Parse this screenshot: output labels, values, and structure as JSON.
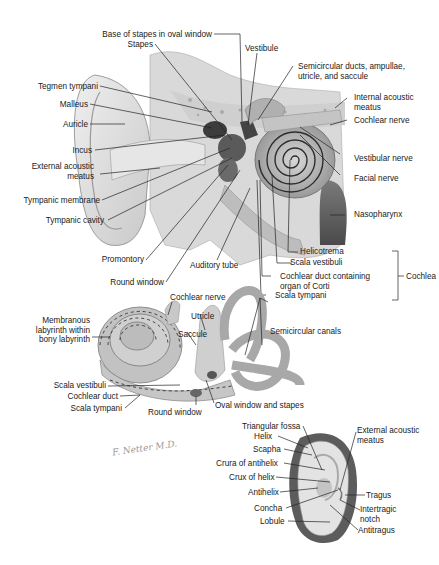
{
  "figure": {
    "signature": "F. Netter M.D."
  },
  "middle_ear_section": {
    "labels": {
      "base_of_stapes": "Base of stapes in oval window",
      "stapes": "Stapes",
      "vestibule": "Vestibule",
      "semicircular_ducts": "Semicircular ducts, ampullae,",
      "semicircular_ducts_2": "utricle, and saccule",
      "tegmen_tympani": "Tegmen tympani",
      "internal_acoustic_meatus": "Internal acoustic",
      "internal_acoustic_meatus_2": "meatus",
      "malleus": "Malleus",
      "cochlear_nerve": "Cochlear nerve",
      "auricle": "Auricle",
      "incus": "Incus",
      "vestibular_nerve": "Vestibular nerve",
      "external_acoustic_meatus": "External acoustic",
      "external_acoustic_meatus_2": "meatus",
      "facial_nerve": "Facial nerve",
      "tympanic_membrane": "Tympanic membrane",
      "tympanic_cavity": "Tympanic cavity",
      "nasopharynx": "Nasopharynx",
      "promontory": "Promontory",
      "auditory_tube": "Auditory tube",
      "round_window": "Round window",
      "helicotrema": "Helicotrema",
      "scala_vestibuli": "Scala vestibuli",
      "cochlear_duct": "Cochlear duct containing",
      "cochlear_duct_2": "organ of Corti",
      "scala_tympani": "Scala tympani",
      "cochlea": "Cochlea"
    }
  },
  "labyrinth_section": {
    "labels": {
      "cochlear_nerve": "Cochlear nerve",
      "membranous_labyrinth": "Membranous",
      "membranous_labyrinth_2": "labyrinth within",
      "membranous_labyrinth_3": "bony labyrinth",
      "utricle": "Utricle",
      "saccule": "Saccule",
      "semicircular_canals": "Semicircular canals",
      "scala_vestibuli": "Scala vestibuli",
      "cochlear_duct": "Cochlear duct",
      "scala_tympani": "Scala tympani",
      "round_window": "Round window",
      "oval_window": "Oval window and stapes"
    }
  },
  "auricle_section": {
    "labels": {
      "triangular_fossa": "Triangular fossa",
      "helix": "Helix",
      "external_acoustic_meatus": "External acoustic",
      "external_acoustic_meatus_2": "meatus",
      "scapha": "Scapha",
      "crura_of_antihelix": "Crura of antihelix",
      "crux_of_helix": "Crux of helix",
      "antihelix": "Antihelix",
      "tragus": "Tragus",
      "concha": "Concha",
      "intertragic_notch": "Intertragic",
      "intertragic_notch_2": "notch",
      "lobule": "Lobule",
      "antitragus": "Antitragus"
    }
  }
}
